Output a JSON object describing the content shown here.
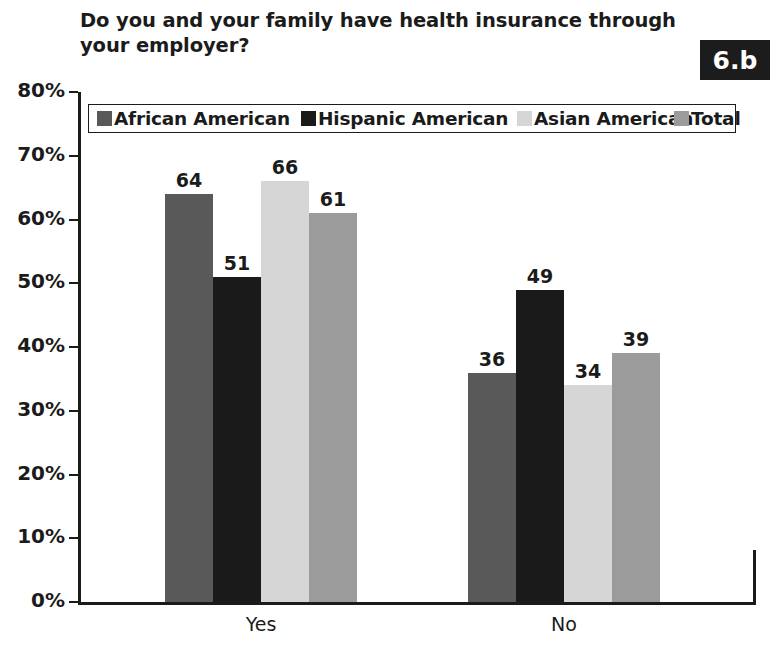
{
  "title": "Do you and your family have health insurance through\nyour employer?",
  "badge": "6.b",
  "axis": {
    "yticks": [
      "80%",
      "70%",
      "60%",
      "50%",
      "40%",
      "30%",
      "20%",
      "10%",
      "0%"
    ]
  },
  "legend": [
    {
      "label": "African American",
      "color": "#595959"
    },
    {
      "label": "Hispanic American",
      "color": "#1a1a1a"
    },
    {
      "label": "Asian American",
      "color": "#d6d6d6"
    },
    {
      "label": "Total",
      "color": "#9b9b9b"
    }
  ],
  "chart_data": {
    "type": "bar",
    "title": "Do you and your family have health insurance through your employer?",
    "xlabel": "",
    "ylabel": "",
    "ylim": [
      0,
      80
    ],
    "ytick_values": [
      0,
      10,
      20,
      30,
      40,
      50,
      60,
      70,
      80
    ],
    "ytick_labels": [
      "0%",
      "10%",
      "20%",
      "30%",
      "40%",
      "50%",
      "60%",
      "70%",
      "80%"
    ],
    "grid": false,
    "legend_position": "top-inside",
    "categories": [
      "Yes",
      "No"
    ],
    "series": [
      {
        "name": "African American",
        "color": "#595959",
        "values": [
          64,
          36
        ]
      },
      {
        "name": "Hispanic American",
        "color": "#1a1a1a",
        "values": [
          51,
          49
        ]
      },
      {
        "name": "Asian American",
        "color": "#d6d6d6",
        "values": [
          66,
          34
        ]
      },
      {
        "name": "Total",
        "color": "#9b9b9b",
        "values": [
          61,
          39
        ]
      }
    ],
    "data_labels": [
      {
        "category": "Yes",
        "series": "African American",
        "value": 64
      },
      {
        "category": "Yes",
        "series": "Hispanic American",
        "value": 51
      },
      {
        "category": "Yes",
        "series": "Asian American",
        "value": 66
      },
      {
        "category": "Yes",
        "series": "Total",
        "value": 61
      },
      {
        "category": "No",
        "series": "African American",
        "value": 36
      },
      {
        "category": "No",
        "series": "Hispanic American",
        "value": 49
      },
      {
        "category": "No",
        "series": "Asian American",
        "value": 34
      },
      {
        "category": "No",
        "series": "Total",
        "value": 39
      }
    ]
  }
}
